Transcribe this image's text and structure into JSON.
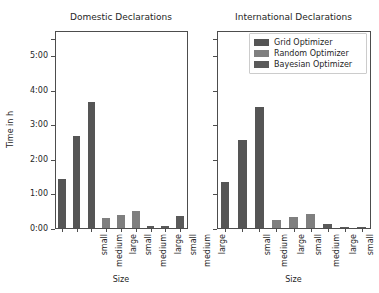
{
  "chart_data": {
    "type": "bar",
    "title": "",
    "xlabel": "Size",
    "ylabel": "Time in h",
    "ylim": [
      0,
      5.75
    ],
    "ytick_values": [
      0,
      1,
      2,
      3,
      4,
      5
    ],
    "ytick_labels": [
      "0:00",
      "1:00",
      "2:00",
      "3:00",
      "4:00",
      "5:00"
    ],
    "grid": false,
    "legend_position": "upper right of second panel",
    "legend": [
      "Grid Optimizer",
      "Random Optimizer",
      "Bayesian Optimizer"
    ],
    "colors": {
      "grid_optimizer": "#555555",
      "random_optimizer": "#7f7f7f",
      "bayesian_optimizer": "#5a5a5a"
    },
    "categories": [
      "small",
      "medium",
      "large",
      "small",
      "medium",
      "large",
      "small",
      "medium",
      "large"
    ],
    "panels": [
      {
        "title": "Domestic Declarations",
        "xlabel": "Size",
        "bars": [
          {
            "series": "Grid Optimizer",
            "size": "small",
            "value": 1.45
          },
          {
            "series": "Grid Optimizer",
            "size": "medium",
            "value": 2.68
          },
          {
            "series": "Grid Optimizer",
            "size": "large",
            "value": 3.67
          },
          {
            "series": "Random Optimizer",
            "size": "small",
            "value": 0.31
          },
          {
            "series": "Random Optimizer",
            "size": "medium",
            "value": 0.4
          },
          {
            "series": "Random Optimizer",
            "size": "large",
            "value": 0.52
          },
          {
            "series": "Bayesian Optimizer",
            "size": "small",
            "value": 0.07
          },
          {
            "series": "Bayesian Optimizer",
            "size": "medium",
            "value": 0.08
          },
          {
            "series": "Bayesian Optimizer",
            "size": "large",
            "value": 0.36
          }
        ]
      },
      {
        "title": "International Declarations",
        "xlabel": "Size",
        "bars": [
          {
            "series": "Grid Optimizer",
            "size": "small",
            "value": 1.35
          },
          {
            "series": "Grid Optimizer",
            "size": "medium",
            "value": 2.57
          },
          {
            "series": "Grid Optimizer",
            "size": "large",
            "value": 3.52
          },
          {
            "series": "Random Optimizer",
            "size": "small",
            "value": 0.25
          },
          {
            "series": "Random Optimizer",
            "size": "medium",
            "value": 0.33
          },
          {
            "series": "Random Optimizer",
            "size": "large",
            "value": 0.43
          },
          {
            "series": "Bayesian Optimizer",
            "size": "small",
            "value": 0.13
          },
          {
            "series": "Bayesian Optimizer",
            "size": "medium",
            "value": 0.05
          },
          {
            "series": "Bayesian Optimizer",
            "size": "large",
            "value": 0.05
          }
        ]
      }
    ]
  }
}
